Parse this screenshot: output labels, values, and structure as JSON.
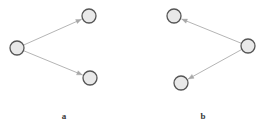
{
  "figure": {
    "width": 269,
    "height": 126,
    "background_color": "#ffffff",
    "caption_a": "a",
    "caption_b": "b"
  },
  "style": {
    "node_fill": "#e9e9e9",
    "node_stroke": "#555555",
    "node_stroke_width": 1.3,
    "node_radius": 7,
    "edge_color": "#b5b5b5",
    "edge_width": 1,
    "arrowhead_color": "#a8a8a8",
    "label_color": "#3a3a3a"
  },
  "chart_data": {
    "type": "diagram",
    "title": "",
    "panels": [
      {
        "id": "a",
        "label": "a",
        "label_x": 64,
        "label_y": 112,
        "direction": "out",
        "nodes": [
          {
            "id": "a-source",
            "name": "source-node",
            "x": 17,
            "y": 48,
            "r": 7
          },
          {
            "id": "a-target-top",
            "name": "target-node-top",
            "x": 89,
            "y": 16,
            "r": 7
          },
          {
            "id": "a-target-bottom",
            "name": "target-node-bottom",
            "x": 90,
            "y": 78,
            "r": 7
          }
        ],
        "edges": [
          {
            "from": "a-source",
            "to": "a-target-top",
            "arrow": "end"
          },
          {
            "from": "a-source",
            "to": "a-target-bottom",
            "arrow": "end"
          }
        ]
      },
      {
        "id": "b",
        "label": "b",
        "label_x": 203,
        "label_y": 112,
        "direction": "out",
        "nodes": [
          {
            "id": "b-source",
            "name": "source-node",
            "x": 248,
            "y": 46,
            "r": 7
          },
          {
            "id": "b-target-top",
            "name": "target-node-top",
            "x": 174,
            "y": 16,
            "r": 7
          },
          {
            "id": "b-target-bottom",
            "name": "target-node-bottom",
            "x": 181,
            "y": 83,
            "r": 7
          }
        ],
        "edges": [
          {
            "from": "b-source",
            "to": "b-target-top",
            "arrow": "end"
          },
          {
            "from": "b-source",
            "to": "b-target-bottom",
            "arrow": "end"
          }
        ]
      }
    ]
  }
}
